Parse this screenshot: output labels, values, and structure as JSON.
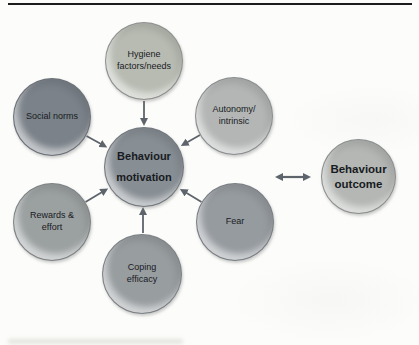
{
  "figure": {
    "background_color": "#fcfcfa",
    "top_rule_color": "#1c1c1c",
    "arrow_color": "#5d646b",
    "text_color": "#181b1f"
  },
  "nodes": [
    {
      "id": "hygiene-factors",
      "label": "Hygiene\nfactors/needs",
      "color": "#b8bbb2",
      "bold": false
    },
    {
      "id": "social-norms",
      "label": "Social norms",
      "color": "#7b8289",
      "bold": false
    },
    {
      "id": "autonomy-intrinsic",
      "label": "Autonomy/\nintrinsic",
      "color": "#b3b6b4",
      "bold": false
    },
    {
      "id": "behaviour-motivation",
      "label": "Behaviour\nmotivation",
      "color": "#878e94",
      "bold": true
    },
    {
      "id": "rewards-effort",
      "label": "Rewards &\neffort",
      "color": "#9ba0a1",
      "bold": false
    },
    {
      "id": "fear",
      "label": "Fear",
      "color": "#969ba0",
      "bold": false
    },
    {
      "id": "coping-efficacy",
      "label": "Coping\nefficacy",
      "color": "#989da0",
      "bold": false
    },
    {
      "id": "behaviour-outcome",
      "label": "Behaviour\noutcome",
      "color": "#b4b7b3",
      "bold": true
    }
  ],
  "edges": [
    {
      "from": "hygiene-factors",
      "to": "behaviour-motivation",
      "type": "arrow"
    },
    {
      "from": "social-norms",
      "to": "behaviour-motivation",
      "type": "arrow"
    },
    {
      "from": "autonomy-intrinsic",
      "to": "behaviour-motivation",
      "type": "arrow"
    },
    {
      "from": "rewards-effort",
      "to": "behaviour-motivation",
      "type": "arrow"
    },
    {
      "from": "fear",
      "to": "behaviour-motivation",
      "type": "arrow"
    },
    {
      "from": "coping-efficacy",
      "to": "behaviour-motivation",
      "type": "arrow"
    },
    {
      "from": "behaviour-motivation",
      "to": "behaviour-outcome",
      "type": "double-arrow"
    }
  ]
}
